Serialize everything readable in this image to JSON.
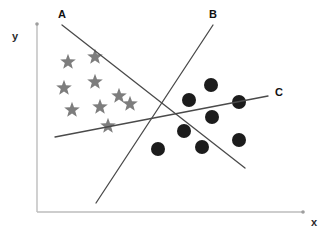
{
  "figure": {
    "title": "",
    "background_color": "#ffffff",
    "width": 325,
    "height": 233
  },
  "axes": {
    "x_label": "x",
    "y_label": "y",
    "axis_color": "#bdbdbd",
    "origin": {
      "x": 37,
      "y": 212
    },
    "x_end": {
      "x": 303,
      "y": 212
    },
    "y_end": {
      "x": 37,
      "y": 24
    },
    "x_label_pos": {
      "x": 314,
      "y": 226
    },
    "y_label_pos": {
      "x": 15,
      "y": 40
    }
  },
  "chart_data": {
    "type": "scatter",
    "title": "",
    "xlabel": "x",
    "ylabel": "y",
    "grid": false,
    "legend": "none",
    "xlim": [
      0,
      100
    ],
    "ylim": [
      0,
      100
    ],
    "series": [
      {
        "name": "star-class",
        "marker": "star",
        "color": "#7d7d7d",
        "count": 10,
        "points": [
          {
            "x": 68,
            "y": 62
          },
          {
            "x": 95,
            "y": 57
          },
          {
            "x": 64,
            "y": 88
          },
          {
            "x": 95,
            "y": 82
          },
          {
            "x": 72,
            "y": 110
          },
          {
            "x": 100,
            "y": 107
          },
          {
            "x": 119,
            "y": 96
          },
          {
            "x": 130,
            "y": 104
          },
          {
            "x": 108,
            "y": 126
          }
        ]
      },
      {
        "name": "circle-class",
        "marker": "circle",
        "color": "#1c1c1c",
        "count": 9,
        "points": [
          {
            "x": 211,
            "y": 85
          },
          {
            "x": 189,
            "y": 100
          },
          {
            "x": 239,
            "y": 102
          },
          {
            "x": 212,
            "y": 117
          },
          {
            "x": 184,
            "y": 131
          },
          {
            "x": 239,
            "y": 140
          },
          {
            "x": 158,
            "y": 149
          },
          {
            "x": 202,
            "y": 147
          }
        ]
      }
    ],
    "annotations": [
      {
        "label": "A",
        "type": "decision-boundary",
        "x1": 62,
        "y1": 25,
        "x2": 245,
        "y2": 168,
        "label_pos": {
          "x": 62,
          "y": 18
        }
      },
      {
        "label": "B",
        "type": "decision-boundary",
        "x1": 96,
        "y1": 203,
        "x2": 213,
        "y2": 25,
        "label_pos": {
          "x": 213,
          "y": 18
        }
      },
      {
        "label": "C",
        "type": "decision-boundary",
        "x1": 55,
        "y1": 137,
        "x2": 268,
        "y2": 96,
        "label_pos": {
          "x": 275,
          "y": 96
        }
      }
    ]
  },
  "labels": {
    "line_a": "A",
    "line_b": "B",
    "line_c": "C",
    "axis_x": "x",
    "axis_y": "y"
  }
}
